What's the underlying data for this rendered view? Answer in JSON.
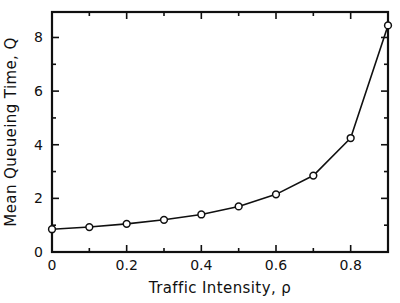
{
  "chart_data": {
    "type": "line",
    "title": "",
    "subtitle": "",
    "xlabel": "Traffic Intensity, ρ",
    "ylabel": "Mean Queueing Time, Q",
    "xlim": [
      0,
      0.9
    ],
    "ylim": [
      0,
      8.95
    ],
    "grid": false,
    "legend": null,
    "marker": "open-circle",
    "line_color": "#101010",
    "marker_face_color": "#ffffff",
    "marker_edge_color": "#101010",
    "x_major_ticks": [
      0,
      0.2,
      0.4,
      0.6,
      0.8
    ],
    "x_major_tick_labels": [
      "0",
      "0.2",
      "0.4",
      "0.6",
      "0.8"
    ],
    "x_minor_ticks": [
      0.1,
      0.3,
      0.5,
      0.7,
      0.9
    ],
    "y_major_ticks": [
      0,
      2,
      4,
      6,
      8
    ],
    "y_major_tick_labels": [
      "0",
      "2",
      "4",
      "6",
      "8"
    ],
    "y_minor_ticks": [
      1,
      3,
      5,
      7
    ],
    "x": [
      0.0,
      0.1,
      0.2,
      0.3,
      0.4,
      0.5,
      0.6,
      0.7,
      0.8,
      0.9
    ],
    "values": [
      0.85,
      0.93,
      1.05,
      1.2,
      1.4,
      1.7,
      2.15,
      2.85,
      4.25,
      8.45
    ],
    "series": [
      {
        "name": "Mean Queueing Time",
        "x": [
          0.0,
          0.1,
          0.2,
          0.3,
          0.4,
          0.5,
          0.6,
          0.7,
          0.8,
          0.9
        ],
        "values": [
          0.85,
          0.93,
          1.05,
          1.2,
          1.4,
          1.7,
          2.15,
          2.85,
          4.25,
          8.45
        ]
      }
    ]
  }
}
